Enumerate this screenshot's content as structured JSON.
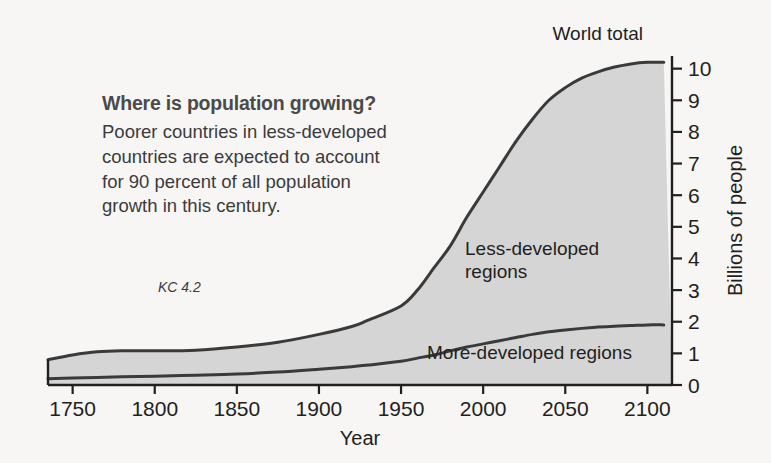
{
  "callout": {
    "headline": "Where is population growing?",
    "body": "Poorer countries in less-developed countries are expected to account for 90 percent of all population growth in this century."
  },
  "figure_code": "KC 4.2",
  "colors": {
    "fill": "#d5d5d5",
    "line": "#3a3a3a",
    "axis": "#231f20",
    "headline": "#4a4a4a",
    "background": "#f7f6f4"
  },
  "chart_data": {
    "type": "area",
    "title": "",
    "subtitle": "",
    "xlabel": "Year",
    "ylabel": "Billions of people",
    "xlim": [
      1735,
      2115
    ],
    "ylim": [
      0,
      10.4
    ],
    "xticks": [
      1750,
      1800,
      1850,
      1900,
      1950,
      2000,
      2050,
      2100
    ],
    "xticklabels": [
      "1750",
      "1800",
      "1850",
      "1900",
      "1950",
      "2000",
      "2050",
      "2100"
    ],
    "yticks": [
      0,
      1,
      2,
      3,
      4,
      5,
      6,
      7,
      8,
      9,
      10
    ],
    "yticklabels": [
      "0",
      "1",
      "2",
      "3",
      "4",
      "5",
      "6",
      "7",
      "8",
      "9",
      "10"
    ],
    "y_axis_position": "right",
    "grid": false,
    "legend": "inline-annotations",
    "annotations": [
      {
        "name": "world-total",
        "text": "World total",
        "x": 2020,
        "y": 10.3
      },
      {
        "name": "less-developed-regions",
        "text": "Less-developed regions",
        "x": 2005,
        "y": 4.6
      },
      {
        "name": "more-developed-regions",
        "text": "More-developed regions",
        "x": 2020,
        "y": 1.1
      }
    ],
    "x": [
      1735,
      1750,
      1765,
      1780,
      1800,
      1825,
      1850,
      1875,
      1900,
      1920,
      1930,
      1950,
      1960,
      1970,
      1980,
      1990,
      2000,
      2010,
      2020,
      2030,
      2040,
      2050,
      2060,
      2070,
      2080,
      2090,
      2100,
      2110
    ],
    "series": [
      {
        "name": "World total",
        "values": [
          0.8,
          0.95,
          1.05,
          1.08,
          1.08,
          1.1,
          1.2,
          1.35,
          1.6,
          1.85,
          2.05,
          2.5,
          3.0,
          3.7,
          4.4,
          5.3,
          6.1,
          6.9,
          7.7,
          8.4,
          9.0,
          9.4,
          9.7,
          9.9,
          10.05,
          10.15,
          10.2,
          10.2
        ]
      },
      {
        "name": "More-developed regions",
        "values": [
          0.2,
          0.22,
          0.24,
          0.26,
          0.28,
          0.31,
          0.35,
          0.41,
          0.5,
          0.58,
          0.63,
          0.75,
          0.85,
          0.95,
          1.08,
          1.2,
          1.3,
          1.4,
          1.5,
          1.6,
          1.68,
          1.74,
          1.79,
          1.83,
          1.86,
          1.88,
          1.9,
          1.9
        ]
      },
      {
        "name": "Less-developed regions",
        "derived": "World total minus More-developed regions",
        "values": [
          0.6,
          0.73,
          0.81,
          0.82,
          0.8,
          0.79,
          0.85,
          0.94,
          1.1,
          1.27,
          1.42,
          1.75,
          2.15,
          2.75,
          3.32,
          4.1,
          4.8,
          5.5,
          6.2,
          6.8,
          7.32,
          7.66,
          7.91,
          8.07,
          8.19,
          8.27,
          8.3,
          8.3
        ]
      }
    ]
  }
}
